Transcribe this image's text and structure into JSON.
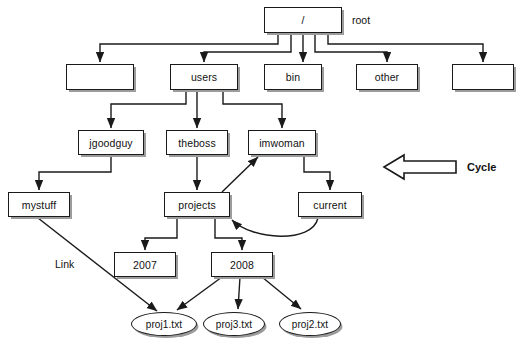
{
  "diagram": {
    "background_color": "#ffffff",
    "node_border_color": "#1a1a1a",
    "node_fill_color": "#ffffff",
    "shadow_color": "#9c9c9c",
    "edge_color": "#1a1a1a",
    "nodes": [
      {
        "id": "root",
        "label": "/",
        "shape": "rect",
        "x": 264,
        "y": 7,
        "w": 78,
        "h": 26
      },
      {
        "id": "empty1",
        "label": "",
        "shape": "rect",
        "x": 66,
        "y": 64,
        "w": 68,
        "h": 26
      },
      {
        "id": "users",
        "label": "users",
        "shape": "rect",
        "x": 170,
        "y": 64,
        "w": 68,
        "h": 26
      },
      {
        "id": "bin",
        "label": "bin",
        "shape": "rect",
        "x": 264,
        "y": 64,
        "w": 58,
        "h": 26
      },
      {
        "id": "other",
        "label": "other",
        "shape": "rect",
        "x": 356,
        "y": 64,
        "w": 62,
        "h": 26
      },
      {
        "id": "empty2",
        "label": "",
        "shape": "rect",
        "x": 452,
        "y": 64,
        "w": 62,
        "h": 26
      },
      {
        "id": "jgoodguy",
        "label": "jgoodguy",
        "shape": "rect",
        "x": 78,
        "y": 130,
        "w": 66,
        "h": 25
      },
      {
        "id": "theboss",
        "label": "theboss",
        "shape": "rect",
        "x": 166,
        "y": 130,
        "w": 62,
        "h": 25
      },
      {
        "id": "imwoman",
        "label": "imwoman",
        "shape": "rect",
        "x": 248,
        "y": 130,
        "w": 68,
        "h": 25
      },
      {
        "id": "mystuff",
        "label": "mystuff",
        "shape": "rect",
        "x": 8,
        "y": 192,
        "w": 62,
        "h": 25
      },
      {
        "id": "projects",
        "label": "projects",
        "shape": "rect",
        "x": 164,
        "y": 192,
        "w": 66,
        "h": 25
      },
      {
        "id": "current",
        "label": "current",
        "shape": "rect",
        "x": 298,
        "y": 192,
        "w": 64,
        "h": 25
      },
      {
        "id": "y2007",
        "label": "2007",
        "shape": "rect",
        "x": 114,
        "y": 252,
        "w": 62,
        "h": 25
      },
      {
        "id": "y2008",
        "label": "2008",
        "shape": "rect",
        "x": 211,
        "y": 252,
        "w": 62,
        "h": 25
      },
      {
        "id": "proj1",
        "label": "proj1.txt",
        "shape": "ellipse",
        "x": 131,
        "y": 312,
        "w": 66,
        "h": 24
      },
      {
        "id": "proj3",
        "label": "proj3.txt",
        "shape": "ellipse",
        "x": 203,
        "y": 312,
        "w": 62,
        "h": 24
      },
      {
        "id": "proj2",
        "label": "proj2.txt",
        "shape": "ellipse",
        "x": 279,
        "y": 312,
        "w": 62,
        "h": 24
      }
    ],
    "annotations": [
      {
        "id": "root-label",
        "text": "root",
        "x": 352,
        "y": 14,
        "bold": false
      },
      {
        "id": "link-label",
        "text": "Link",
        "x": 55,
        "y": 258,
        "bold": false
      },
      {
        "id": "cycle-label",
        "text": "Cycle",
        "x": 467,
        "y": 161,
        "bold": true
      }
    ],
    "edges": [
      {
        "from": "root",
        "to": "empty1",
        "style": "orthogonal"
      },
      {
        "from": "root",
        "to": "users",
        "style": "orthogonal"
      },
      {
        "from": "root",
        "to": "bin",
        "style": "orthogonal"
      },
      {
        "from": "root",
        "to": "other",
        "style": "orthogonal"
      },
      {
        "from": "root",
        "to": "empty2",
        "style": "orthogonal"
      },
      {
        "from": "users",
        "to": "jgoodguy",
        "style": "orthogonal"
      },
      {
        "from": "users",
        "to": "theboss",
        "style": "orthogonal"
      },
      {
        "from": "users",
        "to": "imwoman",
        "style": "orthogonal"
      },
      {
        "from": "jgoodguy",
        "to": "mystuff",
        "style": "orthogonal"
      },
      {
        "from": "theboss",
        "to": "projects",
        "style": "orthogonal"
      },
      {
        "from": "imwoman",
        "to": "current",
        "style": "orthogonal"
      },
      {
        "from": "projects",
        "to": "imwoman",
        "style": "diagonal"
      },
      {
        "from": "current",
        "to": "projects",
        "style": "curved"
      },
      {
        "from": "projects",
        "to": "y2007",
        "style": "orthogonal"
      },
      {
        "from": "projects",
        "to": "y2008",
        "style": "orthogonal"
      },
      {
        "from": "mystuff",
        "to": "proj1",
        "style": "diagonal",
        "label": "Link"
      },
      {
        "from": "y2008",
        "to": "proj1",
        "style": "diagonal"
      },
      {
        "from": "y2008",
        "to": "proj3",
        "style": "diagonal"
      },
      {
        "from": "y2008",
        "to": "proj2",
        "style": "diagonal"
      }
    ],
    "cycle_marker": {
      "direction": "left",
      "x": 382,
      "y": 152,
      "w": 76,
      "h": 30
    }
  }
}
